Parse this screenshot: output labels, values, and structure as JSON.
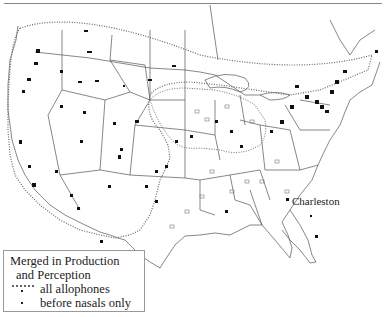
{
  "map": {
    "type": "dialect isogloss map",
    "region": "United States and southern Canada",
    "labels": {
      "city": "Charleston"
    }
  },
  "legend": {
    "title_line1": "Merged in Production",
    "title_line2": "and Perception",
    "items": [
      {
        "symbol": "dotted-line",
        "label": "all allophones"
      },
      {
        "symbol": "small-dot",
        "label": "before nasals only"
      }
    ]
  }
}
